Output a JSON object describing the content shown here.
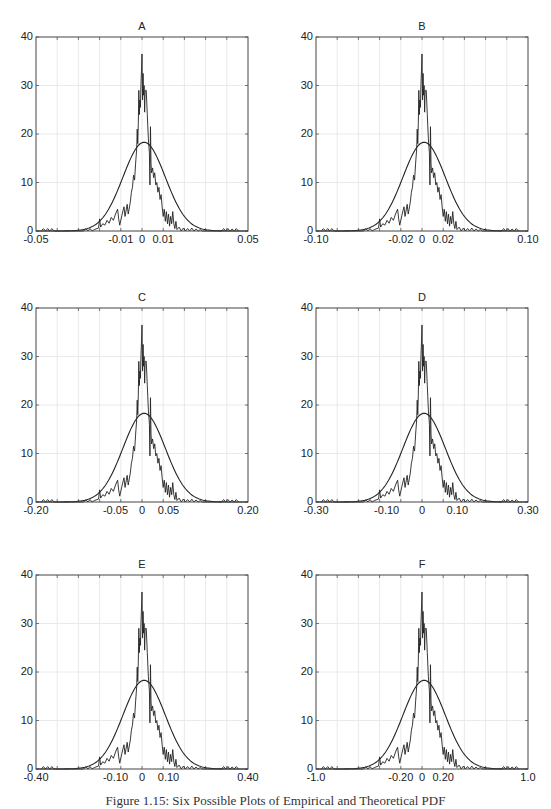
{
  "figure": {
    "caption": "Figure 1.15: Six Possible Plots of Empirical and Theoretical PDF"
  },
  "chart_data": [
    {
      "type": "line",
      "title": "A",
      "xlim": [
        -0.05,
        0.05
      ],
      "ylim": [
        0,
        40
      ],
      "yticks": [
        0,
        10,
        20,
        30,
        40
      ],
      "xtick_labels": [
        {
          "value": -0.05,
          "label": "-0.05"
        },
        {
          "value": -0.01,
          "label": "-0.01"
        },
        {
          "value": 0,
          "label": "0"
        },
        {
          "value": 0.01,
          "label": "0.01"
        },
        {
          "value": 0.05,
          "label": "0.05"
        }
      ],
      "grid": true,
      "series": [
        {
          "name": "Empirical PDF",
          "style": "jagged line",
          "peak": 36.5,
          "peak_x": 0
        },
        {
          "name": "Theoretical PDF",
          "style": "smooth normal curve",
          "peak": 18.3,
          "peak_x": 0.001
        }
      ]
    },
    {
      "type": "line",
      "title": "B",
      "xlim": [
        -0.1,
        0.1
      ],
      "ylim": [
        0,
        40
      ],
      "yticks": [
        0,
        10,
        20,
        30,
        40
      ],
      "xtick_labels": [
        {
          "value": -0.1,
          "label": "-0.10"
        },
        {
          "value": -0.02,
          "label": "-0.02"
        },
        {
          "value": 0,
          "label": "0"
        },
        {
          "value": 0.02,
          "label": "0.02"
        },
        {
          "value": 0.1,
          "label": "0.10"
        }
      ],
      "grid": true,
      "series": [
        {
          "name": "Empirical PDF",
          "style": "jagged line",
          "peak": 36.5,
          "peak_x": 0
        },
        {
          "name": "Theoretical PDF",
          "style": "smooth normal curve",
          "peak": 18.3,
          "peak_x": 0.002
        }
      ]
    },
    {
      "type": "line",
      "title": "C",
      "xlim": [
        -0.2,
        0.2
      ],
      "ylim": [
        0,
        40
      ],
      "yticks": [
        0,
        10,
        20,
        30,
        40
      ],
      "xtick_labels": [
        {
          "value": -0.2,
          "label": "-0.20"
        },
        {
          "value": -0.05,
          "label": "-0.05"
        },
        {
          "value": 0,
          "label": "0"
        },
        {
          "value": 0.05,
          "label": "0.05"
        },
        {
          "value": 0.2,
          "label": "0.20"
        }
      ],
      "grid": true,
      "series": [
        {
          "name": "Empirical PDF",
          "style": "jagged line",
          "peak": 36.5,
          "peak_x": 0
        },
        {
          "name": "Theoretical PDF",
          "style": "smooth normal curve",
          "peak": 18.3,
          "peak_x": 0.004
        }
      ]
    },
    {
      "type": "line",
      "title": "D",
      "xlim": [
        -0.3,
        0.3
      ],
      "ylim": [
        0,
        40
      ],
      "yticks": [
        0,
        10,
        20,
        30,
        40
      ],
      "xtick_labels": [
        {
          "value": -0.3,
          "label": "-0.30"
        },
        {
          "value": -0.1,
          "label": "-0.10"
        },
        {
          "value": 0,
          "label": "0"
        },
        {
          "value": 0.1,
          "label": "0.10"
        },
        {
          "value": 0.3,
          "label": "0.30"
        }
      ],
      "grid": true,
      "series": [
        {
          "name": "Empirical PDF",
          "style": "jagged line",
          "peak": 36.5,
          "peak_x": 0
        },
        {
          "name": "Theoretical PDF",
          "style": "smooth normal curve",
          "peak": 18.3,
          "peak_x": 0.006
        }
      ]
    },
    {
      "type": "line",
      "title": "E",
      "xlim": [
        -0.4,
        0.4
      ],
      "ylim": [
        0,
        40
      ],
      "yticks": [
        0,
        10,
        20,
        30,
        40
      ],
      "xtick_labels": [
        {
          "value": -0.4,
          "label": "-0.40"
        },
        {
          "value": -0.1,
          "label": "-0.10"
        },
        {
          "value": 0,
          "label": "0"
        },
        {
          "value": 0.1,
          "label": "0.10"
        },
        {
          "value": 0.4,
          "label": "0.40"
        }
      ],
      "grid": true,
      "series": [
        {
          "name": "Empirical PDF",
          "style": "jagged line",
          "peak": 36.5,
          "peak_x": 0
        },
        {
          "name": "Theoretical PDF",
          "style": "smooth normal curve",
          "peak": 18.3,
          "peak_x": 0.008
        }
      ]
    },
    {
      "type": "line",
      "title": "F",
      "xlim": [
        -1.0,
        1.0
      ],
      "ylim": [
        0,
        40
      ],
      "yticks": [
        0,
        10,
        20,
        30,
        40
      ],
      "xtick_labels": [
        {
          "value": -1.0,
          "label": "-1.0"
        },
        {
          "value": -0.2,
          "label": "-0.20"
        },
        {
          "value": 0,
          "label": "0"
        },
        {
          "value": 0.2,
          "label": "0.20"
        },
        {
          "value": 1.0,
          "label": "1.0"
        }
      ],
      "grid": true,
      "series": [
        {
          "name": "Empirical PDF",
          "style": "jagged line",
          "peak": 36.5,
          "peak_x": 0
        },
        {
          "name": "Theoretical PDF",
          "style": "smooth normal curve",
          "peak": 18.3,
          "peak_x": 0.02
        }
      ]
    }
  ],
  "shared_shape": {
    "note": "All six panels show the same curves; only the x-axis scale differs. Values below are in normalized x units (fraction of half-range, -1..1) and y density.",
    "empirical_points": [
      [
        -0.95,
        0
      ],
      [
        -0.93,
        0.5
      ],
      [
        -0.91,
        0
      ],
      [
        -0.89,
        0.5
      ],
      [
        -0.87,
        0
      ],
      [
        -0.85,
        0.5
      ],
      [
        -0.83,
        0
      ],
      [
        -0.55,
        0
      ],
      [
        -0.53,
        0.5
      ],
      [
        -0.51,
        0
      ],
      [
        -0.49,
        0.5
      ],
      [
        -0.47,
        0
      ],
      [
        -0.45,
        0.3
      ],
      [
        -0.41,
        0.6
      ],
      [
        -0.4,
        2.5
      ],
      [
        -0.39,
        0.8
      ],
      [
        -0.37,
        1.5
      ],
      [
        -0.35,
        1.2
      ],
      [
        -0.33,
        2.2
      ],
      [
        -0.31,
        1.6
      ],
      [
        -0.29,
        2.8
      ],
      [
        -0.27,
        2.2
      ],
      [
        -0.25,
        3.5
      ],
      [
        -0.23,
        4.5
      ],
      [
        -0.22,
        2.5
      ],
      [
        -0.21,
        1.2
      ],
      [
        -0.19,
        3.2
      ],
      [
        -0.17,
        5
      ],
      [
        -0.16,
        3
      ],
      [
        -0.14,
        5.5
      ],
      [
        -0.13,
        3.5
      ],
      [
        -0.11,
        6
      ],
      [
        -0.1,
        8
      ],
      [
        -0.09,
        9
      ],
      [
        -0.08,
        11.5
      ],
      [
        -0.07,
        10.5
      ],
      [
        -0.06,
        14
      ],
      [
        -0.05,
        17
      ],
      [
        -0.045,
        21
      ],
      [
        -0.04,
        18
      ],
      [
        -0.035,
        22
      ],
      [
        -0.03,
        29
      ],
      [
        -0.025,
        24
      ],
      [
        -0.02,
        27
      ],
      [
        -0.015,
        25.5
      ],
      [
        -0.01,
        30
      ],
      [
        -0.005,
        33
      ],
      [
        0,
        36.5
      ],
      [
        0.005,
        27
      ],
      [
        0.01,
        32.5
      ],
      [
        0.015,
        28
      ],
      [
        0.02,
        30
      ],
      [
        0.025,
        24.5
      ],
      [
        0.03,
        29
      ],
      [
        0.04,
        29
      ],
      [
        0.05,
        24
      ],
      [
        0.06,
        19
      ],
      [
        0.07,
        16
      ],
      [
        0.075,
        9.5
      ],
      [
        0.08,
        21.5
      ],
      [
        0.085,
        14
      ],
      [
        0.09,
        12
      ],
      [
        0.1,
        13
      ],
      [
        0.11,
        11
      ],
      [
        0.12,
        12
      ],
      [
        0.13,
        9.5
      ],
      [
        0.14,
        10
      ],
      [
        0.15,
        8
      ],
      [
        0.16,
        9
      ],
      [
        0.17,
        6.5
      ],
      [
        0.18,
        7.5
      ],
      [
        0.19,
        5
      ],
      [
        0.2,
        3
      ],
      [
        0.21,
        4.5
      ],
      [
        0.22,
        2
      ],
      [
        0.23,
        4
      ],
      [
        0.24,
        1.5
      ],
      [
        0.25,
        3.5
      ],
      [
        0.26,
        1
      ],
      [
        0.27,
        3
      ],
      [
        0.28,
        1.5
      ],
      [
        0.29,
        4
      ],
      [
        0.3,
        1.5
      ],
      [
        0.31,
        0.5
      ],
      [
        0.32,
        2
      ],
      [
        0.33,
        0.3
      ],
      [
        0.35,
        0.8
      ],
      [
        0.37,
        0
      ],
      [
        0.39,
        0.6
      ],
      [
        0.41,
        0
      ],
      [
        0.43,
        0.5
      ],
      [
        0.45,
        0
      ],
      [
        0.47,
        0.6
      ],
      [
        0.49,
        0
      ],
      [
        0.51,
        0.4
      ],
      [
        0.53,
        0
      ],
      [
        0.55,
        0.3
      ],
      [
        0.57,
        0
      ],
      [
        0.75,
        0
      ],
      [
        0.77,
        0.5
      ],
      [
        0.79,
        0
      ],
      [
        0.81,
        0.5
      ],
      [
        0.83,
        0
      ],
      [
        0.85,
        0.4
      ],
      [
        0.87,
        0
      ],
      [
        0.89,
        0.5
      ],
      [
        0.91,
        0
      ]
    ],
    "theoretical": {
      "mean": 0.02,
      "sigma": 0.2,
      "peak": 18.3
    }
  }
}
